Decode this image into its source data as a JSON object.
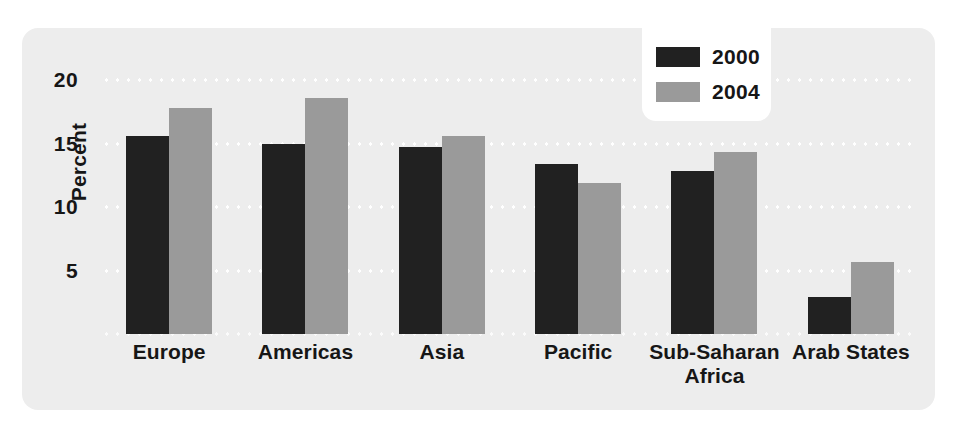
{
  "chart_data": {
    "type": "bar",
    "title": "",
    "xlabel": "",
    "ylabel": "Percent",
    "ylim": [
      0,
      20
    ],
    "yticks": [
      20,
      15,
      10,
      5
    ],
    "grid": true,
    "legend_position": "top-right",
    "categories": [
      "Europe",
      "Americas",
      "Asia",
      "Pacific",
      "Sub-Saharan Africa",
      "Arab States"
    ],
    "category_lines": [
      [
        "Europe"
      ],
      [
        "Americas"
      ],
      [
        "Asia"
      ],
      [
        "Pacific"
      ],
      [
        "Sub-Saharan",
        "Africa"
      ],
      [
        "Arab States"
      ]
    ],
    "series": [
      {
        "name": "2000",
        "color": "#212121",
        "values": [
          15.6,
          15.0,
          14.7,
          13.4,
          12.8,
          2.9
        ]
      },
      {
        "name": "2004",
        "color": "#9a9a9a",
        "values": [
          17.8,
          18.6,
          15.6,
          11.9,
          14.3,
          5.7
        ]
      }
    ]
  },
  "legend": {
    "entries": [
      {
        "label": "2000"
      },
      {
        "label": "2004"
      }
    ]
  },
  "colors": {
    "panel_background": "#ededed",
    "page_background": "#ffffff",
    "gridline": "#ffffff",
    "text": "#161616",
    "series_2000": "#212121",
    "series_2004": "#9a9a9a"
  }
}
